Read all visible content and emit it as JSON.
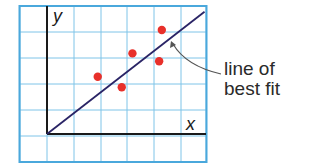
{
  "chart_data": {
    "type": "scatter",
    "title": "",
    "xlabel": "x",
    "ylabel": "y",
    "grid": true,
    "xlim": [
      -1,
      6
    ],
    "ylim": [
      -1,
      5
    ],
    "points": [
      {
        "x": 1.9,
        "y": 2.2
      },
      {
        "x": 2.8,
        "y": 1.8
      },
      {
        "x": 3.2,
        "y": 3.1
      },
      {
        "x": 4.2,
        "y": 2.8
      },
      {
        "x": 4.3,
        "y": 4.0
      }
    ],
    "trend_line": {
      "label": "line of best fit",
      "from": {
        "x": 0,
        "y": 0
      },
      "to": {
        "x": 5.9,
        "y": 4.7
      }
    },
    "annotation": {
      "line1": "line of",
      "line2": "best fit"
    },
    "colors": {
      "grid": "#7fc4e8",
      "border": "#4aa8dc",
      "points": "#e8302a",
      "line": "#2a2466",
      "axes": "#1a1a1a"
    }
  }
}
